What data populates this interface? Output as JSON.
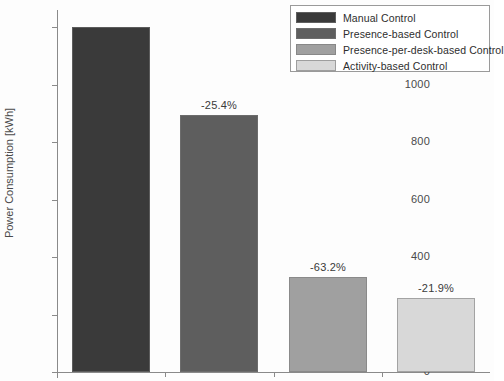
{
  "chart_data": {
    "type": "bar",
    "title": "",
    "xlabel": "",
    "ylabel": "Power Consumption [kWh]",
    "ylim": [
      0,
      1260
    ],
    "yticks": [
      0,
      200,
      400,
      600,
      800,
      1000,
      1200
    ],
    "ytick_labels": [
      "0",
      "200",
      "400",
      "600",
      "800",
      "1000",
      "1200"
    ],
    "xticks": [],
    "xtick_labels": [],
    "grid": false,
    "legend_position": "upper right",
    "categories": [
      "Manual Control",
      "Presence-based Control",
      "Presence-per-desk-based Control",
      "Activity-based Control"
    ],
    "values": [
      1200,
      895,
      330,
      258
    ],
    "colors": [
      "#3a3a3a",
      "#5e5e5e",
      "#a0a0a0",
      "#d8d8d8"
    ],
    "annotations": [
      "",
      "-25.4%",
      "-63.2%",
      "-21.9%"
    ],
    "bars": [
      {
        "category": "Manual Control",
        "value": 1200,
        "label": "",
        "color": "#3a3a3a"
      },
      {
        "category": "Presence-based Control",
        "value": 895,
        "label": "-25.4%",
        "color": "#5e5e5e"
      },
      {
        "category": "Presence-per-desk-based Control",
        "value": 330,
        "label": "-63.2%",
        "color": "#a0a0a0"
      },
      {
        "category": "Activity-based Control",
        "value": 258,
        "label": "-21.9%",
        "color": "#d8d8d8"
      }
    ],
    "legend": [
      {
        "label": "Manual Control",
        "color": "#3a3a3a"
      },
      {
        "label": "Presence-based Control",
        "color": "#5e5e5e"
      },
      {
        "label": "Presence-per-desk-based Control",
        "color": "#a0a0a0"
      },
      {
        "label": "Activity-based Control",
        "color": "#d8d8d8"
      }
    ]
  }
}
